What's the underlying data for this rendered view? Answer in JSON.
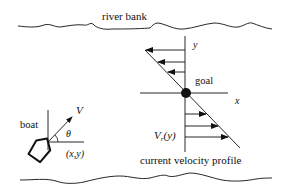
{
  "diagram": {
    "labels": {
      "river_bank": "river bank",
      "y_axis": "y",
      "x_axis": "x",
      "goal": "goal",
      "velocity": "V",
      "theta": "θ",
      "position": "(x,y)",
      "boat": "boat",
      "current_profile_symbol": "V",
      "current_profile_sub": "r",
      "current_profile_arg": "(y)",
      "current_profile_caption": "current velocity profile"
    },
    "colors": {
      "stroke": "#111111",
      "background": "#ffffff"
    },
    "profile": {
      "arrows_above_goal": 3,
      "arrows_below_goal": 3,
      "direction_above": "left",
      "direction_below": "right"
    }
  }
}
